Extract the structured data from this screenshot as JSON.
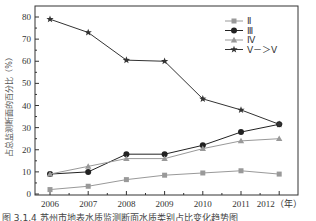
{
  "chart_data": {
    "type": "line",
    "title": "",
    "xlabel": "（年）",
    "ylabel": "占总监测断面的百分比（%）",
    "x": [
      "2006",
      "2007",
      "2008",
      "2009",
      "2010",
      "2011",
      "2012"
    ],
    "ylim": [
      0,
      80
    ],
    "yticks": [
      0,
      10,
      20,
      30,
      40,
      50,
      60,
      70,
      80
    ],
    "grid": false,
    "legend_position": "upper right",
    "series": [
      {
        "name": "II",
        "label": "Ⅱ",
        "marker": "square",
        "color": "#999999",
        "values": [
          2,
          3.5,
          6.5,
          8.5,
          9.5,
          10.5,
          9
        ]
      },
      {
        "name": "III",
        "label": "Ⅲ",
        "marker": "circle",
        "color": "#222222",
        "values": [
          9,
          10,
          18,
          18,
          22,
          28,
          31.5
        ]
      },
      {
        "name": "IV",
        "label": "Ⅳ",
        "marker": "triangle",
        "color": "#999999",
        "values": [
          9,
          12.5,
          16,
          16,
          20.5,
          24,
          25
        ]
      },
      {
        "name": "V->V",
        "label": "Ⅴ－＞Ⅴ",
        "marker": "star",
        "color": "#333333",
        "values": [
          79,
          73,
          60.5,
          60,
          43,
          38,
          31.5
        ]
      }
    ]
  },
  "caption": "图 3.1.4   苏州市地表水质监测断面水质类别占比变化趋势图"
}
